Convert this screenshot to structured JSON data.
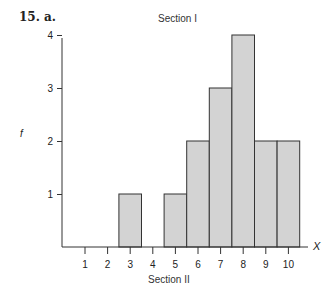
{
  "problem_label": "15.  a.",
  "chart_data": {
    "type": "bar",
    "title": "Section I",
    "subtitle": "Section II",
    "xlabel": "X",
    "ylabel": "f",
    "categories": [
      "1",
      "2",
      "3",
      "4",
      "5",
      "6",
      "7",
      "8",
      "9",
      "10"
    ],
    "values": [
      0,
      0,
      1,
      0,
      1,
      2,
      3,
      4,
      2,
      2
    ],
    "yticks": [
      "1",
      "2",
      "3",
      "4"
    ],
    "ylim": [
      0,
      4
    ],
    "grid": false,
    "bar_color": "#d3d3d3",
    "edge_color": "#333333"
  }
}
